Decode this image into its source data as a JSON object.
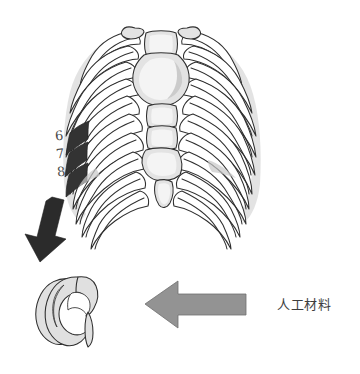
{
  "figure": {
    "background_color": "#ffffff",
    "width": 360,
    "height": 374
  },
  "anatomy": {
    "structure_name": "rib-cage",
    "sternum_name": "sternum",
    "xiphoid_name": "xiphoid-process",
    "highlighted_ribs": [
      "6",
      "7",
      "8"
    ],
    "highlight_color": "#333333",
    "bone_fill_color": "#ffffff",
    "bone_outline_color": "#2f2f2f",
    "shading_color": "#c9c9c9"
  },
  "labels": {
    "rib6": "6",
    "rib7": "7",
    "rib8": "8",
    "material": "人工材料"
  },
  "arrows": {
    "harvest": {
      "name": "harvest-arrow",
      "direction": "down-left",
      "color": "#2b2b2b"
    },
    "material": {
      "name": "material-arrow",
      "direction": "left",
      "color": "#939393"
    }
  },
  "graft": {
    "name": "costal-cartilage-graft",
    "shape": "curved C-shaped harvested rib cartilage",
    "fill_color": "#e0e0e0",
    "outline_color": "#2e2e2e"
  }
}
